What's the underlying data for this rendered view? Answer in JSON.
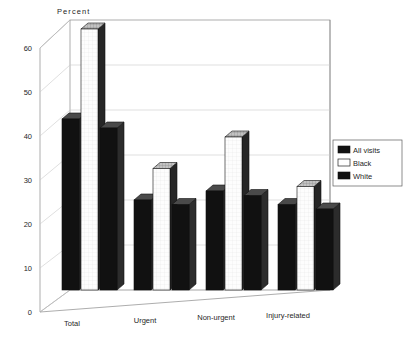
{
  "chart_data": {
    "type": "bar",
    "title": "",
    "ylabel": "Percent",
    "xlabel": "",
    "categories": [
      "Total",
      "Urgent",
      "Non-urgent",
      "Injury-related"
    ],
    "series": [
      {
        "name": "All  visits",
        "values": [
          38,
          20,
          22,
          19
        ],
        "swatch": "#111111"
      },
      {
        "name": "Black",
        "values": [
          58,
          27,
          34,
          23
        ],
        "swatch": "#ffffff"
      },
      {
        "name": "White",
        "values": [
          36,
          19,
          21,
          18
        ],
        "swatch": "#111111"
      }
    ],
    "yticks": [
      0,
      10,
      20,
      30,
      40,
      50,
      60
    ],
    "ylim": [
      0,
      65
    ],
    "grid": true,
    "legend_position": "right",
    "style": "3d-column"
  },
  "axis": {
    "y_title": "Percent",
    "tick_0": "0",
    "tick_10": "10",
    "tick_20": "20",
    "tick_30": "30",
    "tick_40": "40",
    "tick_50": "50",
    "tick_60": "60"
  },
  "categories": {
    "c0": "Total",
    "c1": "Urgent",
    "c2": "Non-urgent",
    "c3": "Injury-related"
  },
  "legend": {
    "item0": "All  visits",
    "item1": "Black",
    "item2": "White"
  }
}
